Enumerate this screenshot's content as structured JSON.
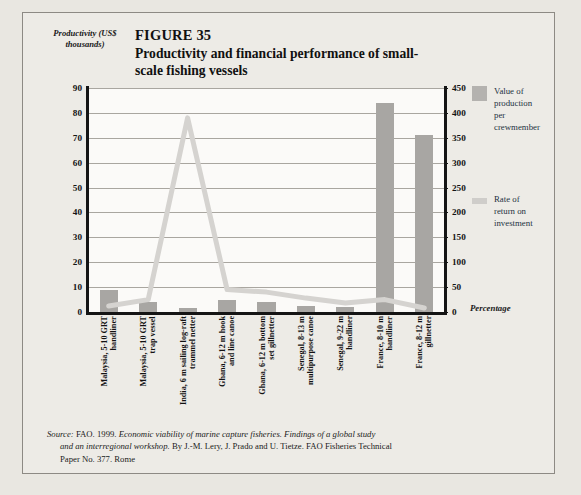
{
  "figure": {
    "number": "FIGURE 35",
    "title": "Productivity and financial performance\nof small-scale fishing vessels"
  },
  "axes": {
    "left_title": "Productivity\n(US$ thousands)",
    "right_title": "Percentage"
  },
  "legend": {
    "items": [
      {
        "name": "value-of-production",
        "label": "Value of\nproduction\nper\ncrewmember",
        "type": "bar",
        "color": "#b4b2af"
      },
      {
        "name": "rate-of-return",
        "label": "Rate of\nreturn on\ninvestment",
        "type": "line",
        "color": "#cfcdca"
      }
    ]
  },
  "source": {
    "line1_prefix": "Source:",
    "line1": " FAO. 1999. ",
    "line1_italic": "Economic viability of marine capture fisheries. Findings of a global study",
    "line2_italic": "and an interregional workshop.",
    "line2": " By J.-M. Lery, J. Prado and U. Tietze. FAO Fisheries Technical",
    "line3": "Paper No. 377. Rome"
  },
  "chart_data": {
    "type": "bar",
    "title": "Productivity and financial performance of small-scale fishing vessels",
    "xlabel": "",
    "ylabel": "Productivity (US$ thousands)",
    "y2label": "Percentage",
    "ylim": [
      0,
      90
    ],
    "y2lim": [
      0,
      450
    ],
    "yticks": [
      0,
      10,
      20,
      30,
      40,
      50,
      60,
      70,
      80,
      90
    ],
    "y2ticks": [
      0,
      50,
      100,
      150,
      200,
      250,
      300,
      350,
      400,
      450
    ],
    "grid": true,
    "legend_position": "right",
    "categories": [
      "Malaysia, 5-10 GRT\nhandliner",
      "Malaysia, 5-10 GRT\ntrap vessel",
      "India, 6 m sailing log-raft\ntrammel netter",
      "Ghana, 6-12 m hook\nand line canoe",
      "Ghana, 6-12 m bottom\nset gillnetter",
      "Senegal, 8-13 m\nmultipurpose canoe",
      "Senegal, 9-22 m\nhandliner",
      "France, 8-10 m\nhandliner",
      "France, 8-12 m\ngillnetter"
    ],
    "series": [
      {
        "name": "Value of production per crewmember",
        "axis": "left",
        "kind": "bar",
        "color": "#a8a6a3",
        "values": [
          9,
          4,
          1.5,
          5,
          4,
          2.5,
          2,
          84,
          71
        ]
      },
      {
        "name": "Rate of return on investment",
        "axis": "right",
        "kind": "line",
        "color": "#d5d3d0",
        "values": [
          12,
          25,
          390,
          45,
          40,
          28,
          18,
          25,
          8
        ]
      }
    ]
  }
}
